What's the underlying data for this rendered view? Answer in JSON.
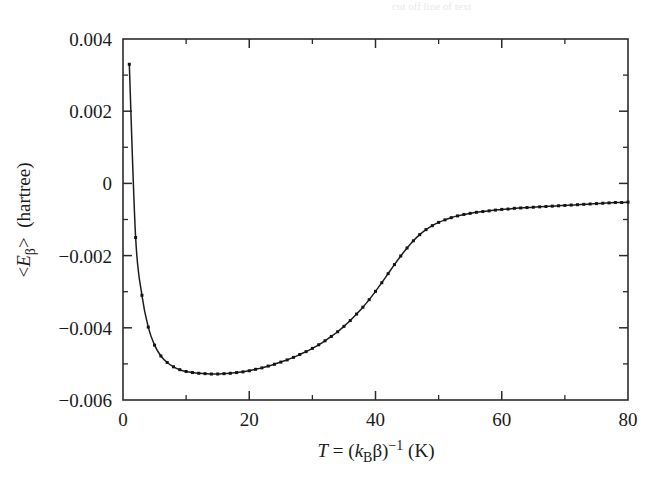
{
  "figure": {
    "background_color": "#ffffff",
    "ink_color": "#1a1a1a",
    "marker_color": "#141414",
    "top_artifact_text": "cut off line of text"
  },
  "axes": {
    "x": {
      "label_parts": {
        "variable": "T",
        "equals": " = (",
        "k_symbol": "k",
        "k_subscript": "B",
        "beta": "β",
        "close_paren": ")",
        "exponent": "−1",
        "unit": "(K)"
      },
      "label_plain": "T = (kʙβ)⁻¹  (K)",
      "major_ticks": [
        0,
        20,
        40,
        60,
        80
      ],
      "major_tick_labels": [
        "0",
        "20",
        "40",
        "60",
        "80"
      ],
      "minor_ticks": [
        10,
        30,
        50,
        70
      ],
      "limits": [
        0,
        80
      ]
    },
    "y": {
      "label_parts": {
        "open_bracket": "<",
        "variable": "E",
        "subscript": "β",
        "close_bracket": ">",
        "unit": "(hartree)"
      },
      "label_plain": "<Eβ>  (hartree)",
      "major_ticks": [
        0.004,
        0.002,
        0,
        -0.002,
        -0.004,
        -0.006
      ],
      "major_tick_labels": [
        "0.004",
        "0.002",
        "0",
        "−0.002",
        "−0.004",
        "−0.006"
      ],
      "minor_ticks": [
        0.003,
        0.001,
        -0.001,
        -0.003,
        -0.005
      ],
      "limits": [
        -0.006,
        0.004
      ]
    }
  },
  "chart_data": {
    "type": "line",
    "title": "",
    "subtitle": "",
    "xlabel": "T = (kʙβ)⁻¹  (K)",
    "ylabel": "<Eβ>  (hartree)",
    "xlim": [
      0,
      80
    ],
    "ylim": [
      -0.006,
      0.004
    ],
    "grid": false,
    "legend": false,
    "legend_position": "none",
    "marker": "square",
    "marker_size": 3,
    "line_color": "#1c1c1c",
    "series": [
      {
        "name": "<E_beta>",
        "x": [
          1.0,
          2.0,
          3.0,
          4.0,
          5.0,
          6.0,
          7.0,
          8.0,
          9.0,
          10.0,
          11.0,
          12.0,
          13.0,
          14.0,
          15.0,
          16.0,
          17.0,
          18.0,
          19.0,
          20.0,
          21.0,
          22.0,
          23.0,
          24.0,
          25.0,
          26.0,
          27.0,
          28.0,
          29.0,
          30.0,
          31.0,
          32.0,
          33.0,
          34.0,
          35.0,
          36.0,
          37.0,
          38.0,
          39.0,
          40.0,
          41.0,
          42.0,
          43.0,
          44.0,
          45.0,
          46.0,
          47.0,
          48.0,
          49.0,
          50.0,
          51.0,
          52.0,
          53.0,
          54.0,
          55.0,
          56.0,
          57.0,
          58.0,
          59.0,
          60.0,
          61.0,
          62.0,
          63.0,
          64.0,
          65.0,
          66.0,
          67.0,
          68.0,
          69.0,
          70.0,
          71.0,
          72.0,
          73.0,
          74.0,
          75.0,
          76.0,
          77.0,
          78.0,
          79.0,
          80.0
        ],
        "y": [
          0.0033,
          -0.0015,
          -0.0031,
          -0.00398,
          -0.00448,
          -0.00478,
          -0.00496,
          -0.00508,
          -0.00516,
          -0.00521,
          -0.00524,
          -0.00526,
          -0.00527,
          -0.00528,
          -0.00528,
          -0.00527,
          -0.00526,
          -0.00524,
          -0.00522,
          -0.00519,
          -0.00515,
          -0.00511,
          -0.00506,
          -0.00501,
          -0.00495,
          -0.00489,
          -0.00482,
          -0.00474,
          -0.00466,
          -0.00457,
          -0.00447,
          -0.00436,
          -0.00424,
          -0.00411,
          -0.00396,
          -0.0038,
          -0.00362,
          -0.00343,
          -0.00322,
          -0.00299,
          -0.00275,
          -0.0025,
          -0.00225,
          -0.00201,
          -0.00179,
          -0.00159,
          -0.00142,
          -0.00128,
          -0.00117,
          -0.00108,
          -0.00101,
          -0.00095,
          -0.0009,
          -0.00086,
          -0.00083,
          -0.0008,
          -0.00078,
          -0.00076,
          -0.00074,
          -0.00072,
          -0.00071,
          -0.00069,
          -0.00068,
          -0.00067,
          -0.00066,
          -0.00065,
          -0.00064,
          -0.00063,
          -0.00062,
          -0.00061,
          -0.0006,
          -0.00059,
          -0.00058,
          -0.00057,
          -0.00056,
          -0.00055,
          -0.00054,
          -0.00053,
          -0.00053,
          -0.00052
        ]
      }
    ]
  }
}
